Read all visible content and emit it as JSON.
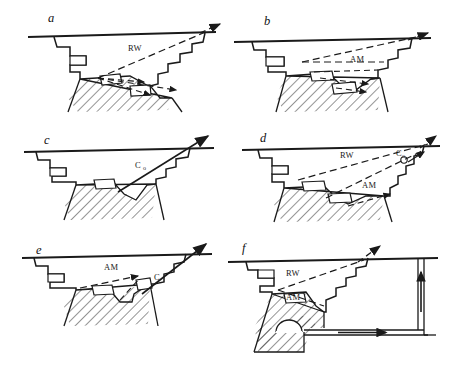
{
  "figure": {
    "background_color": "#ffffff",
    "line_color": "#1a1a1a",
    "hatch_color": "#2b2b2b",
    "width": 455,
    "height": 370
  },
  "panels": [
    {
      "id": "a",
      "letter": "a",
      "labels": [
        {
          "text": "RW",
          "sub": ""
        }
      ],
      "flow_arrow_style": "dashed",
      "has_ground_line": true,
      "has_hatched_rock": true
    },
    {
      "id": "b",
      "letter": "b",
      "labels": [
        {
          "text": "AM",
          "sub": ""
        }
      ],
      "flow_arrow_style": "dashed",
      "has_ground_line": true,
      "has_hatched_rock": true
    },
    {
      "id": "c",
      "letter": "c",
      "labels": [
        {
          "text": "C",
          "sub": "o"
        }
      ],
      "flow_arrow_style": "solid",
      "has_ground_line": true,
      "has_hatched_rock": true
    },
    {
      "id": "d",
      "letter": "d",
      "labels": [
        {
          "text": "RW",
          "sub": ""
        },
        {
          "text": "AM",
          "sub": ""
        },
        {
          "text": "C",
          "sub": "o"
        }
      ],
      "flow_arrow_style": "dashed",
      "has_ground_line": true,
      "has_hatched_rock": true
    },
    {
      "id": "e",
      "letter": "e",
      "labels": [
        {
          "text": "AM",
          "sub": ""
        },
        {
          "text": "C",
          "sub": ""
        }
      ],
      "flow_arrow_style": "mixed",
      "has_ground_line": true,
      "has_hatched_rock": true
    },
    {
      "id": "f",
      "letter": "f",
      "labels": [
        {
          "text": "RW",
          "sub": ""
        },
        {
          "text": "AM",
          "sub": ""
        }
      ],
      "flow_arrow_style": "dashed",
      "has_ground_line": true,
      "has_hatched_rock": true,
      "has_underground_shaft": true,
      "has_adit_tunnel": true
    }
  ]
}
